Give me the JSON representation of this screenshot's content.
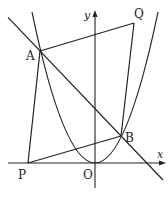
{
  "diagram": {
    "type": "coordinate-geometry",
    "colors": {
      "stroke": "#222222",
      "background": "#ffffff"
    },
    "axes": {
      "x_label": "x",
      "y_label": "y",
      "origin_label": "O"
    },
    "points": {
      "A": {
        "label": "A",
        "px": [
          40,
          51
        ]
      },
      "B": {
        "label": "B",
        "px": [
          121,
          136
        ]
      },
      "P": {
        "label": "P",
        "px": [
          28,
          163
        ]
      },
      "Q": {
        "label": "Q",
        "px": [
          134,
          23
        ]
      },
      "O": {
        "label": "O",
        "px": [
          95,
          163
        ]
      }
    },
    "segments": [
      {
        "from": "P",
        "to": "A"
      },
      {
        "from": "A",
        "to": "Q"
      },
      {
        "from": "Q",
        "to": "B"
      },
      {
        "from": "B",
        "to": "P"
      }
    ],
    "line": {
      "name": "AB",
      "extended": true
    },
    "curve": {
      "name": "parabola",
      "vertex": "O",
      "opens": "up"
    }
  }
}
